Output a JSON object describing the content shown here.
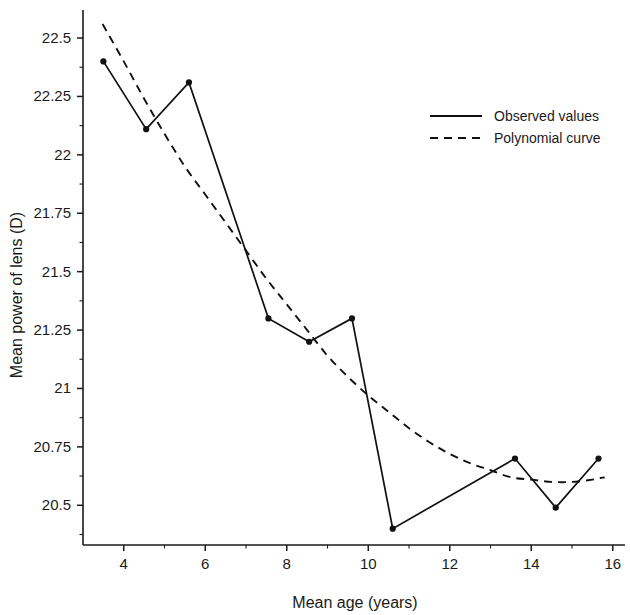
{
  "chart_data": {
    "type": "line",
    "title": "",
    "xlabel": "Mean age (years)",
    "ylabel": "Mean power of lens (D)",
    "xlim": [
      3.0,
      16.3
    ],
    "ylim": [
      20.33,
      22.62
    ],
    "grid": false,
    "legend_position": "top-right",
    "x_ticks": [
      4,
      6,
      8,
      10,
      12,
      14,
      16
    ],
    "x_tick_labels": [
      "4",
      "6",
      "8",
      "10",
      "12",
      "14",
      "16"
    ],
    "x_minor_ticks": [
      5,
      7,
      9,
      11,
      13,
      15
    ],
    "y_ticks": [
      20.5,
      20.75,
      21,
      21.25,
      21.5,
      21.75,
      22,
      22.25,
      22.5
    ],
    "y_tick_labels": [
      "20.5",
      "20.75",
      "21",
      "21.25",
      "21.5",
      "21.75",
      "22",
      "22.25",
      "22.5"
    ],
    "y_minor_ticks": [
      20.375,
      20.625,
      20.875,
      21.125,
      21.375,
      21.625,
      21.875,
      22.125,
      22.375
    ],
    "series": [
      {
        "name": "Observed values",
        "style": "solid",
        "markers": true,
        "points": [
          {
            "x": 3.5,
            "y": 22.4
          },
          {
            "x": 4.55,
            "y": 22.11
          },
          {
            "x": 5.6,
            "y": 22.31
          },
          {
            "x": 7.55,
            "y": 21.3
          },
          {
            "x": 8.55,
            "y": 21.2
          },
          {
            "x": 9.6,
            "y": 21.3
          },
          {
            "x": 10.6,
            "y": 20.4
          },
          {
            "x": 13.6,
            "y": 20.7
          },
          {
            "x": 14.6,
            "y": 20.49
          },
          {
            "x": 15.65,
            "y": 20.7
          }
        ]
      },
      {
        "name": "Polynomial curve",
        "style": "dashed",
        "markers": false,
        "points": [
          {
            "x": 3.48,
            "y": 22.56
          },
          {
            "x": 4.0,
            "y": 22.4
          },
          {
            "x": 4.5,
            "y": 22.24
          },
          {
            "x": 5.0,
            "y": 22.09
          },
          {
            "x": 5.5,
            "y": 21.95
          },
          {
            "x": 6.0,
            "y": 21.83
          },
          {
            "x": 6.5,
            "y": 21.71
          },
          {
            "x": 7.0,
            "y": 21.59
          },
          {
            "x": 7.5,
            "y": 21.47
          },
          {
            "x": 8.0,
            "y": 21.36
          },
          {
            "x": 8.5,
            "y": 21.25
          },
          {
            "x": 9.0,
            "y": 21.14
          },
          {
            "x": 9.5,
            "y": 21.05
          },
          {
            "x": 10.0,
            "y": 20.97
          },
          {
            "x": 10.5,
            "y": 20.9
          },
          {
            "x": 11.0,
            "y": 20.83
          },
          {
            "x": 11.5,
            "y": 20.77
          },
          {
            "x": 12.0,
            "y": 20.72
          },
          {
            "x": 12.5,
            "y": 20.68
          },
          {
            "x": 13.0,
            "y": 20.65
          },
          {
            "x": 13.5,
            "y": 20.62
          },
          {
            "x": 14.0,
            "y": 20.61
          },
          {
            "x": 14.5,
            "y": 20.6
          },
          {
            "x": 15.0,
            "y": 20.6
          },
          {
            "x": 15.5,
            "y": 20.61
          },
          {
            "x": 15.8,
            "y": 20.62
          }
        ]
      }
    ]
  },
  "legend": {
    "entries": [
      {
        "label": "Observed values",
        "style": "solid"
      },
      {
        "label": "Polynomial curve",
        "style": "dashed"
      }
    ]
  },
  "colors": {
    "ink": "#111111",
    "background": "#ffffff"
  }
}
